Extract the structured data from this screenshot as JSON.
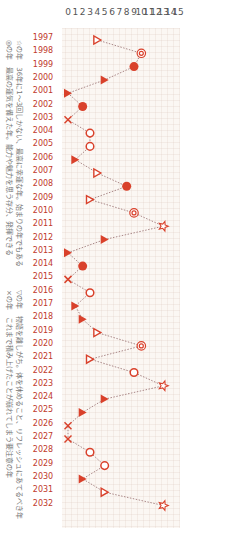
{
  "chart_data": {
    "type": "line",
    "orientation": "rotated 90deg clockwise",
    "title": "",
    "xlabel": "",
    "ylabel": "",
    "ylim": [
      0,
      15
    ],
    "yticks": [
      "0",
      "1",
      "2",
      "3",
      "4",
      "5",
      "6",
      "7",
      "8",
      "9",
      "10",
      "11",
      "12",
      "13",
      "14",
      "15"
    ],
    "categories": [
      "1997",
      "1998",
      "1999",
      "2000",
      "2001",
      "2002",
      "2003",
      "2004",
      "2005",
      "2006",
      "2007",
      "2008",
      "2009",
      "2010",
      "2011",
      "2012",
      "2013",
      "2014",
      "2015",
      "2016",
      "2017",
      "2018",
      "2019",
      "2020",
      "2021",
      "2022",
      "2023",
      "2024",
      "2025",
      "2026",
      "2027",
      "2028",
      "2029",
      "2030",
      "2031",
      "2032"
    ],
    "values": [
      4,
      10,
      9,
      5,
      0,
      2,
      0,
      3,
      3,
      1,
      4,
      8,
      3,
      9,
      13,
      5,
      0,
      2,
      0,
      3,
      1,
      2,
      4,
      10,
      3,
      9,
      13,
      5,
      2,
      0,
      0,
      3,
      5,
      2,
      5,
      13
    ],
    "markers": [
      "triangle-open",
      "double-circle",
      "dot",
      "triangle-filled",
      "triangle-filled",
      "dot",
      "cross",
      "circle-open",
      "circle-open",
      "triangle-filled",
      "triangle-open",
      "dot",
      "triangle-open",
      "double-circle",
      "star",
      "triangle-filled",
      "triangle-filled",
      "dot",
      "cross",
      "circle-open",
      "triangle-filled",
      "triangle-filled",
      "triangle-open",
      "double-circle",
      "triangle-open",
      "circle-open",
      "star",
      "triangle-filled",
      "triangle-filled",
      "cross",
      "cross",
      "circle-open",
      "circle-open",
      "triangle-filled",
      "triangle-open",
      "star"
    ],
    "legend": [
      {
        "symbol": "☆",
        "text": "36年に1～3回しかない、最高に幸運な年。始まりの年でもある"
      },
      {
        "symbol": "◎",
        "text": "最高の運気を備えた年。能力や魅力を思う存分、発揮できる"
      },
      {
        "symbol": "▽",
        "text": "物語を離しがち。体を休めること、リフレッシュにあてるべき年"
      },
      {
        "symbol": "×",
        "text": "これまで積み上げたことが崩れてしまう要注意の年"
      }
    ],
    "grid": true,
    "line_style": "dotted",
    "color": "#d9412b"
  },
  "captions": {
    "line1": "☆の年　36年に1～3回しかない、最高に幸運な年。始まりの年でもある",
    "line2": "◎の年　最高の運気を備えた年。能力や魅力を思う存分、発揮できる",
    "line3": "▽の年　物語を離しがち。体を休めること、リフレッシュにあてるべき年",
    "line4": "×の年　これまで積み上げたことが崩れてしまう要注意の年"
  }
}
